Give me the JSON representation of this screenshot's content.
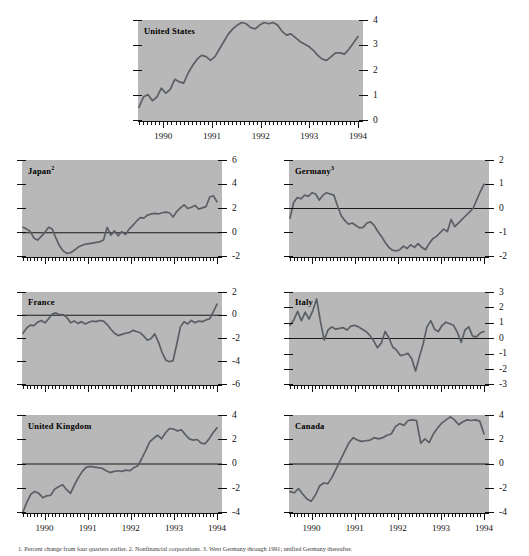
{
  "figure": {
    "background": "#ffffff",
    "panel_background": "#b8b8b8",
    "line_color": "#5a5f66",
    "zero_line_color": "#1a1a1a",
    "footnote": "1. Percent change from four quarters earlier.   2. Nonfinancial corporations.   3. West Germany through 1991; unified Germany thereafter."
  },
  "chart_data": {
    "type": "line",
    "title": "",
    "xlabel": "",
    "ylabel": "",
    "grid": false,
    "legend": "none",
    "x_tick_labels": [
      "1990",
      "1991",
      "1992",
      "1993",
      "1994"
    ],
    "x_range": [
      1989.5,
      1994.0
    ],
    "x_tick_values": [
      1990,
      1991,
      1992,
      1993,
      1994
    ],
    "panels": [
      {
        "name": "united-states",
        "label": "United States",
        "superscript": "",
        "ylim": [
          0,
          4
        ],
        "yticks": [
          4,
          3,
          2,
          1,
          0
        ],
        "zero_line": false,
        "values": [
          0.55,
          0.95,
          1.05,
          0.8,
          0.95,
          1.3,
          1.1,
          1.25,
          1.65,
          1.55,
          1.5,
          1.9,
          2.2,
          2.45,
          2.6,
          2.55,
          2.4,
          2.55,
          2.85,
          3.15,
          3.45,
          3.65,
          3.8,
          3.9,
          3.85,
          3.7,
          3.65,
          3.8,
          3.9,
          3.85,
          3.9,
          3.8,
          3.55,
          3.4,
          3.45,
          3.3,
          3.15,
          3.05,
          2.95,
          2.8,
          2.6,
          2.45,
          2.4,
          2.55,
          2.7,
          2.7,
          2.65,
          2.85,
          3.1,
          3.35
        ]
      },
      {
        "name": "japan",
        "label": "Japan",
        "superscript": "2",
        "ylim": [
          -2,
          6
        ],
        "yticks": [
          6,
          4,
          2,
          0,
          -2
        ],
        "zero_line": true,
        "values": [
          0.45,
          0.3,
          0.1,
          -0.45,
          -0.6,
          -0.3,
          0.05,
          0.45,
          0.3,
          -0.45,
          -1.1,
          -1.5,
          -1.7,
          -1.65,
          -1.45,
          -1.2,
          -1.05,
          -0.95,
          -0.9,
          -0.85,
          -0.8,
          -0.75,
          -0.6,
          0.45,
          -0.2,
          0.15,
          -0.25,
          0.1,
          -0.15,
          0.3,
          0.6,
          0.95,
          1.25,
          1.2,
          1.45,
          1.55,
          1.6,
          1.55,
          1.65,
          1.7,
          1.65,
          1.3,
          1.75,
          2.05,
          2.3,
          2.0,
          2.1,
          2.25,
          1.95,
          2.05,
          2.15,
          2.95,
          3.05,
          2.55
        ]
      },
      {
        "name": "germany",
        "label": "Germany",
        "superscript": "3",
        "ylim": [
          -2,
          2
        ],
        "yticks": [
          2,
          1,
          0,
          -1,
          -2
        ],
        "zero_line": true,
        "values": [
          -0.4,
          0.25,
          0.45,
          0.4,
          0.55,
          0.5,
          0.65,
          0.6,
          0.35,
          0.55,
          0.65,
          0.6,
          0.55,
          0.1,
          -0.3,
          -0.5,
          -0.65,
          -0.6,
          -0.7,
          -0.8,
          -0.78,
          -0.6,
          -0.55,
          -0.7,
          -0.95,
          -1.15,
          -1.4,
          -1.6,
          -1.72,
          -1.75,
          -1.7,
          -1.55,
          -1.65,
          -1.5,
          -1.6,
          -1.45,
          -1.6,
          -1.7,
          -1.45,
          -1.25,
          -1.15,
          -1.0,
          -0.85,
          -0.95,
          -0.45,
          -0.75,
          -0.6,
          -0.45,
          -0.3,
          -0.15,
          0.0,
          0.35,
          0.7,
          1.0
        ]
      },
      {
        "name": "france",
        "label": "France",
        "superscript": "",
        "ylim": [
          -6,
          2
        ],
        "yticks": [
          2,
          0,
          -2,
          -4,
          -6
        ],
        "zero_line": true,
        "values": [
          -1.55,
          -1.1,
          -0.85,
          -0.9,
          -0.6,
          -0.45,
          -0.65,
          -0.3,
          0.1,
          0.2,
          0.05,
          0.05,
          -0.2,
          -0.65,
          -0.5,
          -0.7,
          -0.55,
          -0.75,
          -0.6,
          -0.5,
          -0.55,
          -0.45,
          -0.5,
          -0.8,
          -1.2,
          -1.55,
          -1.75,
          -1.65,
          -1.55,
          -1.5,
          -1.3,
          -1.4,
          -1.5,
          -1.8,
          -2.15,
          -2.0,
          -1.6,
          -2.3,
          -3.2,
          -3.85,
          -4.0,
          -3.9,
          -2.5,
          -1.0,
          -0.55,
          -0.75,
          -0.45,
          -0.65,
          -0.5,
          -0.55,
          -0.4,
          -0.3,
          0.3,
          0.95
        ]
      },
      {
        "name": "italy",
        "label": "Italy",
        "superscript": "",
        "ylim": [
          -3,
          3
        ],
        "yticks": [
          3,
          2,
          1,
          0,
          -1,
          -2,
          -3
        ],
        "zero_line": true,
        "values": [
          0.85,
          1.2,
          1.75,
          1.15,
          1.7,
          1.25,
          1.8,
          2.55,
          1.1,
          -0.1,
          0.55,
          0.75,
          0.6,
          0.65,
          0.7,
          0.55,
          0.8,
          0.85,
          0.75,
          0.6,
          0.45,
          0.2,
          -0.15,
          -0.6,
          -0.3,
          0.45,
          0.05,
          -0.55,
          -0.75,
          -1.1,
          -1.05,
          -0.95,
          -1.3,
          -2.1,
          -1.2,
          -0.35,
          0.75,
          1.15,
          0.6,
          0.45,
          0.85,
          1.05,
          0.95,
          0.85,
          0.4,
          -0.25,
          0.55,
          0.75,
          0.15,
          0.1,
          0.35,
          0.45
        ]
      },
      {
        "name": "united-kingdom",
        "label": "United Kingdom",
        "superscript": "",
        "ylim": [
          -4,
          4
        ],
        "yticks": [
          4,
          2,
          0,
          -2,
          -4
        ],
        "zero_line": true,
        "values": [
          -3.9,
          -3.1,
          -2.45,
          -2.25,
          -2.4,
          -2.75,
          -2.6,
          -2.55,
          -2.05,
          -1.85,
          -1.7,
          -2.1,
          -2.4,
          -1.7,
          -1.1,
          -0.6,
          -0.25,
          -0.2,
          -0.25,
          -0.3,
          -0.35,
          -0.55,
          -0.7,
          -0.6,
          -0.55,
          -0.6,
          -0.5,
          -0.55,
          -0.3,
          -0.15,
          0.45,
          1.1,
          1.8,
          2.1,
          2.35,
          2.05,
          2.55,
          2.9,
          2.85,
          2.7,
          2.8,
          2.4,
          2.05,
          1.95,
          2.0,
          1.7,
          1.65,
          2.05,
          2.55,
          2.95
        ]
      },
      {
        "name": "canada",
        "label": "Canada",
        "superscript": "",
        "ylim": [
          -4,
          4
        ],
        "yticks": [
          4,
          2,
          0,
          -2,
          -4
        ],
        "zero_line": true,
        "values": [
          -2.25,
          -2.35,
          -2.0,
          -2.45,
          -2.85,
          -3.05,
          -2.55,
          -1.8,
          -1.55,
          -1.6,
          -1.05,
          -0.35,
          0.35,
          1.05,
          1.75,
          2.15,
          1.95,
          1.85,
          1.9,
          1.95,
          2.15,
          2.05,
          2.15,
          2.35,
          2.45,
          3.05,
          3.3,
          3.15,
          3.55,
          3.6,
          3.55,
          1.7,
          2.05,
          1.75,
          2.45,
          2.95,
          3.35,
          3.6,
          3.85,
          3.6,
          3.2,
          3.45,
          3.6,
          3.55,
          3.6,
          3.5,
          2.45
        ]
      }
    ]
  }
}
